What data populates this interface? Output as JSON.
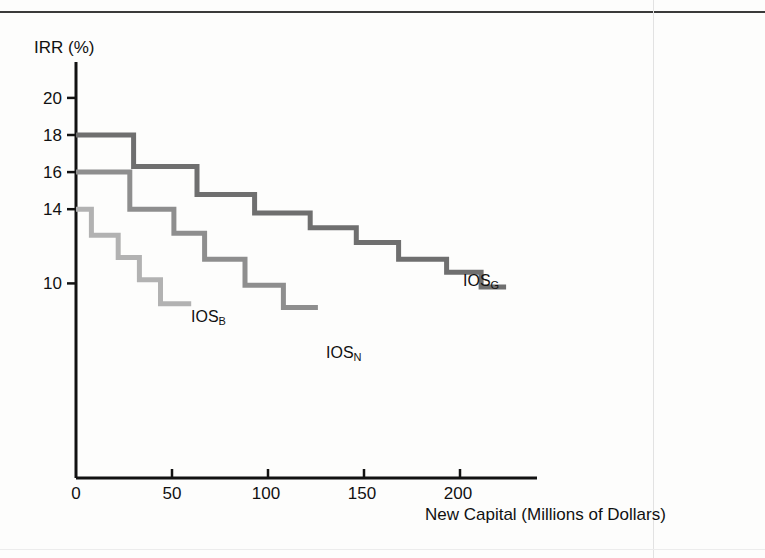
{
  "figure": {
    "background_color": "#fdfdfc",
    "axis_color": "#121212"
  },
  "axes": {
    "y_title": "IRR (%)",
    "x_title": "New Capital (Millions of Dollars)",
    "y_ticks": [
      "20",
      "18",
      "16",
      "14",
      "10"
    ],
    "x_ticks": [
      "0",
      "50",
      "100",
      "150",
      "200"
    ]
  },
  "series_labels": {
    "gross": {
      "base": "IOS",
      "sub": "G"
    },
    "base": {
      "base": "IOS",
      "sub": "B"
    },
    "net": {
      "base": "IOS",
      "sub": "N"
    }
  },
  "colors": {
    "ios_g": "#6f6f6f",
    "ios_b": "#8e8e8e",
    "ios_n": "#b2b2b2",
    "axis": "#121212",
    "text": "#111111"
  },
  "chart_data": {
    "type": "line",
    "subtype": "step",
    "title": "",
    "xlabel": "New Capital (Millions of Dollars)",
    "ylabel": "IRR (%)",
    "xlim": [
      0,
      240
    ],
    "ylim": [
      6.5,
      21.5
    ],
    "xticks": [
      0,
      50,
      100,
      150,
      200
    ],
    "yticks": [
      20,
      18,
      16,
      14,
      10
    ],
    "grid": false,
    "legend": "inline-annotations",
    "series": [
      {
        "name": "IOS_G",
        "label": "IOS(G)",
        "color": "#6f6f6f",
        "description": "Gross investment opportunity schedule",
        "steps": [
          {
            "x_start": 0,
            "x_end": 30,
            "irr": 18.0
          },
          {
            "x_start": 30,
            "x_end": 63,
            "irr": 16.3
          },
          {
            "x_start": 63,
            "x_end": 93,
            "irr": 14.8
          },
          {
            "x_start": 93,
            "x_end": 122,
            "irr": 13.8
          },
          {
            "x_start": 122,
            "x_end": 146,
            "irr": 13.0
          },
          {
            "x_start": 146,
            "x_end": 168,
            "irr": 12.2
          },
          {
            "x_start": 168,
            "x_end": 193,
            "irr": 11.3
          },
          {
            "x_start": 193,
            "x_end": 211,
            "irr": 10.6
          },
          {
            "x_start": 211,
            "x_end": 224,
            "irr": 9.8
          }
        ]
      },
      {
        "name": "IOS_B",
        "label": "IOS(B)",
        "color": "#8e8e8e",
        "description": "Base-case investment opportunity schedule",
        "steps": [
          {
            "x_start": 0,
            "x_end": 28,
            "irr": 16.0
          },
          {
            "x_start": 28,
            "x_end": 51,
            "irr": 14.0
          },
          {
            "x_start": 51,
            "x_end": 67,
            "irr": 12.7
          },
          {
            "x_start": 67,
            "x_end": 88,
            "irr": 11.3
          },
          {
            "x_start": 88,
            "x_end": 108,
            "irr": 9.9
          },
          {
            "x_start": 108,
            "x_end": 126,
            "irr": 8.7
          }
        ]
      },
      {
        "name": "IOS_N",
        "label": "IOS(N)",
        "color": "#b2b2b2",
        "description": "Net investment opportunity schedule",
        "steps": [
          {
            "x_start": 0,
            "x_end": 8,
            "irr": 14.0
          },
          {
            "x_start": 8,
            "x_end": 22,
            "irr": 12.6
          },
          {
            "x_start": 22,
            "x_end": 33,
            "irr": 11.4
          },
          {
            "x_start": 33,
            "x_end": 44,
            "irr": 10.2
          },
          {
            "x_start": 44,
            "x_end": 60,
            "irr": 8.9
          }
        ]
      }
    ]
  },
  "annotations": [
    {
      "name": "ios-g-annotation",
      "text_base": "IOS",
      "text_sub": "G",
      "x": 463,
      "y": 281
    },
    {
      "name": "ios-b-annotation",
      "text_base": "IOS",
      "text_sub": "B",
      "x": 191,
      "y": 317
    },
    {
      "name": "ios-n-annotation",
      "text_base": "IOS",
      "text_sub": "N",
      "x": 326,
      "y": 353
    }
  ]
}
